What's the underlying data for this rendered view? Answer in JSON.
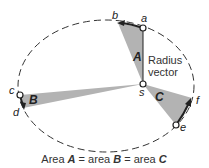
{
  "diagram": {
    "colors": {
      "orbit": "#333333",
      "sector_fill": "#b3b3b3",
      "arrow": "#222222",
      "text": "#222222"
    },
    "points": {
      "a": "a",
      "b": "b",
      "c": "c",
      "d": "d",
      "e": "e",
      "f": "f",
      "s": "s"
    },
    "areas": {
      "A": "A",
      "B": "B",
      "C": "C"
    },
    "radius_vector_label": {
      "line1": "Radius",
      "line2": "vector"
    },
    "caption": {
      "part1": "Area ",
      "A": "A",
      "part2": " = area ",
      "B": "B",
      "part3": " = area ",
      "C": "C"
    }
  }
}
